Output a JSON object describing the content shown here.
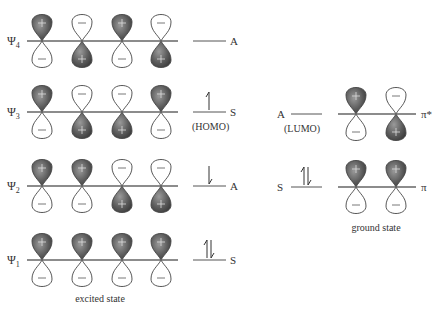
{
  "diagram": {
    "excited_state": {
      "caption": "excited state",
      "levels": [
        {
          "name": "Ψ4",
          "sub": "4",
          "symmetry": "A",
          "electrons": "",
          "tag": "",
          "y": 41,
          "phases": [
            "+",
            "-",
            "+",
            "-"
          ]
        },
        {
          "name": "Ψ3",
          "sub": "3",
          "symmetry": "S",
          "electrons": "up",
          "tag": "(HOMO)",
          "y": 112,
          "phases": [
            "+",
            "-",
            "-",
            "+"
          ]
        },
        {
          "name": "Ψ2",
          "sub": "2",
          "symmetry": "A",
          "electrons": "down",
          "tag": "",
          "y": 186,
          "phases": [
            "+",
            "+",
            "-",
            "-"
          ]
        },
        {
          "name": "Ψ1",
          "sub": "1",
          "symmetry": "S",
          "electrons": "pair",
          "tag": "",
          "y": 260,
          "phases": [
            "+",
            "+",
            "+",
            "+"
          ]
        }
      ]
    },
    "ground_state": {
      "caption": "ground state",
      "levels": [
        {
          "name": "π*",
          "symmetry": "A",
          "electrons": "",
          "tag": "(LUMO)",
          "y": 114,
          "phases": [
            "+",
            "-"
          ]
        },
        {
          "name": "π",
          "symmetry": "S",
          "electrons": "pair",
          "tag": "",
          "y": 187,
          "phases": [
            "+",
            "+"
          ]
        }
      ]
    },
    "colors": {
      "shaded_lobe": "#5a5a5a",
      "line": "#666666",
      "text": "#333333"
    }
  }
}
